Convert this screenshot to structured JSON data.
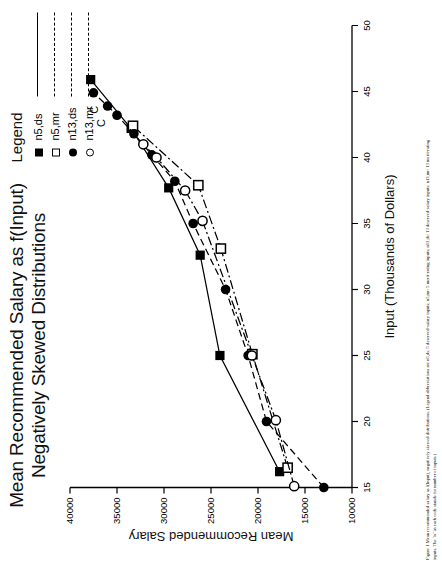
{
  "figure": {
    "title_line1": "Mean Recommended Salary as f(Input)",
    "title_line2": "Negatively Skewed Distributions",
    "caption_label": "Figure 1",
    "caption_text": "Mean recommended salary as f(Input), negatively skewed distributions. (Legend abbreviations are n5,ds: 5 deserved-salary inputs; n5,mr: 5 merit-rating inputs; n13,ds: 13 deserved-salary inputs; n13,mr: 13 merit-rating inputs. The \"n\" in each code stands for number of inputs.)"
  },
  "legend": {
    "title": "Legend",
    "entries": [
      {
        "label": "n5,ds",
        "marker": "filled-square",
        "line": "solid"
      },
      {
        "label": "n5,mr",
        "marker": "open-square",
        "line": "dash-dot"
      },
      {
        "label": "n13,ds",
        "marker": "filled-circle",
        "line": "dashed"
      },
      {
        "label": "n13,mr",
        "marker": "open-circle",
        "line": "dash-dot"
      }
    ]
  },
  "chart_data": {
    "type": "line",
    "title": "Mean Recommended Salary as f(Input) Negatively Skewed Distributions",
    "xlabel": "Input (Thousands of Dollars)",
    "ylabel": "Mean Recommended Salary",
    "xlim": [
      15,
      50
    ],
    "ylim": [
      10000,
      40000
    ],
    "xticks": [
      15,
      20,
      25,
      30,
      35,
      40,
      45,
      50
    ],
    "yticks": [
      10000,
      15000,
      20000,
      25000,
      30000,
      35000,
      40000
    ],
    "grid": false,
    "legend_position": "top-right",
    "annotations": [
      {
        "text": "C",
        "x": 44.6,
        "y": 37450
      },
      {
        "text": "C",
        "x": 43.6,
        "y": 36700
      }
    ],
    "series": [
      {
        "name": "n5,ds",
        "marker": "filled-square",
        "line": "solid",
        "points": [
          {
            "x": 16.2,
            "y": 17700
          },
          {
            "x": 25.0,
            "y": 24050
          },
          {
            "x": 32.6,
            "y": 26150
          },
          {
            "x": 37.7,
            "y": 29500
          },
          {
            "x": 42.2,
            "y": 33500
          },
          {
            "x": 45.9,
            "y": 37800
          }
        ]
      },
      {
        "name": "n5,mr",
        "marker": "open-square",
        "line": "dash-dot",
        "points": [
          {
            "x": 16.5,
            "y": 16850
          },
          {
            "x": 25.1,
            "y": 20600
          },
          {
            "x": 33.1,
            "y": 23950
          },
          {
            "x": 37.9,
            "y": 26350
          },
          {
            "x": 42.4,
            "y": 33300
          }
        ]
      },
      {
        "name": "n13,ds",
        "marker": "filled-circle",
        "line": "dashed",
        "points": [
          {
            "x": 15.0,
            "y": 13000
          },
          {
            "x": 20.0,
            "y": 19100
          },
          {
            "x": 25.0,
            "y": 21050
          },
          {
            "x": 30.0,
            "y": 23450
          },
          {
            "x": 35.0,
            "y": 26900
          },
          {
            "x": 38.2,
            "y": 28850
          },
          {
            "x": 40.2,
            "y": 31300
          },
          {
            "x": 41.8,
            "y": 33200
          },
          {
            "x": 43.2,
            "y": 35000
          },
          {
            "x": 43.9,
            "y": 36000
          },
          {
            "x": 44.9,
            "y": 37500
          }
        ]
      },
      {
        "name": "n13,mr",
        "marker": "open-circle",
        "line": "dash-dot",
        "points": [
          {
            "x": 15.1,
            "y": 16150
          },
          {
            "x": 20.1,
            "y": 18100
          },
          {
            "x": 25.0,
            "y": 20650
          },
          {
            "x": 35.2,
            "y": 25900
          },
          {
            "x": 37.5,
            "y": 27750
          },
          {
            "x": 40.0,
            "y": 30800
          },
          {
            "x": 41.0,
            "y": 32200
          }
        ]
      }
    ]
  }
}
